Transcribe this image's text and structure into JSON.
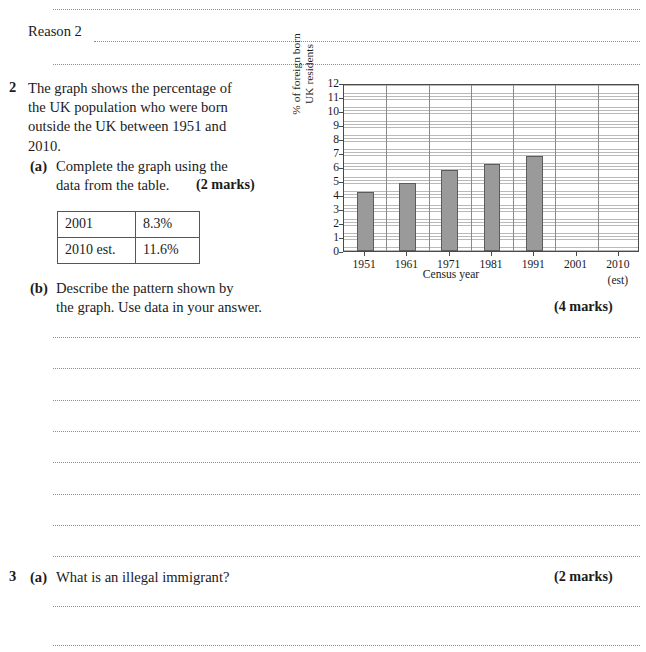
{
  "worksheet": {
    "reason_label": "Reason 2",
    "questions": [
      {
        "number": "2",
        "stem": "The graph shows the percentage of\nthe UK population who were born\noutside the UK between 1951 and\n2010.",
        "parts": [
          {
            "label": "(a)",
            "text": "Complete the graph using the\ndata from the table.",
            "marks": "(2 marks)"
          },
          {
            "label": "(b)",
            "text": "Describe the pattern shown by\nthe graph. Use data in your answer.",
            "marks": "(4 marks)"
          }
        ]
      },
      {
        "number": "3",
        "parts": [
          {
            "label": "(a)",
            "text": "What is an illegal immigrant?",
            "marks": "(2 marks)"
          }
        ]
      }
    ],
    "table": {
      "rows": [
        {
          "year": "2001",
          "percent": "8.3%"
        },
        {
          "year": "2010 est.",
          "percent": "11.6%"
        }
      ]
    }
  },
  "chart_data": {
    "type": "bar",
    "title": "",
    "xlabel": "Census year",
    "ylabel": "% of foreign born\nUK residents",
    "ylabel_line1": "% of foreign born",
    "ylabel_line2": "UK residents",
    "categories": [
      "1951",
      "1961",
      "1971",
      "1981",
      "1991",
      "2001",
      "2010"
    ],
    "category_sublabels": [
      "",
      "",
      "",
      "",
      "",
      "",
      "(est)"
    ],
    "values": [
      4.2,
      4.85,
      5.8,
      6.2,
      6.8,
      null,
      null
    ],
    "yticks": [
      0,
      1,
      2,
      3,
      4,
      5,
      6,
      7,
      8,
      9,
      10,
      11,
      12
    ],
    "ylim": [
      0,
      12
    ],
    "grid": true,
    "legend": "none",
    "bar_color": "#9a9a9a",
    "bar_edge_color": "#5c5c5c",
    "note": "Bars for 2001 and 2010 (est) are blank - to be completed by the student"
  }
}
